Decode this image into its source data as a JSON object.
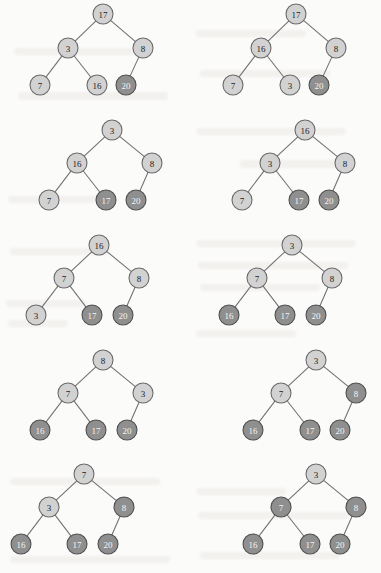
{
  "page": {
    "background_color": "#fbfbfa",
    "node_fill_light": "#d2d2d2",
    "node_fill_dark": "#8f8f8f",
    "node_stroke": "#6a6a6a",
    "edge_color": "#6f6f6f",
    "node_radius": 10,
    "columns": 2,
    "rows": 5,
    "total_trees": 10
  },
  "trees": [
    {
      "id": "tree-1",
      "row": 1,
      "column": "left",
      "nodes": [
        {
          "key": "root",
          "label": "17",
          "shade": "light",
          "x": 103,
          "y": 14
        },
        {
          "key": "left",
          "label": "3",
          "shade": "light",
          "x": 68,
          "y": 48
        },
        {
          "key": "right",
          "label": "8",
          "shade": "light",
          "x": 143,
          "y": 48
        },
        {
          "key": "left-left",
          "label": "7",
          "shade": "light",
          "x": 40,
          "y": 85
        },
        {
          "key": "left-right",
          "label": "16",
          "shade": "light",
          "x": 97,
          "y": 85
        },
        {
          "key": "right-left",
          "label": "20",
          "shade": "dark",
          "x": 126,
          "y": 85
        }
      ],
      "edges": [
        [
          "root",
          "left"
        ],
        [
          "root",
          "right"
        ],
        [
          "left",
          "left-left"
        ],
        [
          "left",
          "left-right"
        ],
        [
          "right",
          "right-left"
        ]
      ]
    },
    {
      "id": "tree-2",
      "row": 1,
      "column": "right",
      "nodes": [
        {
          "key": "root",
          "label": "17",
          "shade": "light",
          "x": 296,
          "y": 14
        },
        {
          "key": "left",
          "label": "16",
          "shade": "light",
          "x": 261,
          "y": 48
        },
        {
          "key": "right",
          "label": "8",
          "shade": "light",
          "x": 336,
          "y": 48
        },
        {
          "key": "left-left",
          "label": "7",
          "shade": "light",
          "x": 233,
          "y": 85
        },
        {
          "key": "left-right",
          "label": "3",
          "shade": "light",
          "x": 290,
          "y": 85
        },
        {
          "key": "right-left",
          "label": "20",
          "shade": "dark",
          "x": 319,
          "y": 85
        }
      ],
      "edges": [
        [
          "root",
          "left"
        ],
        [
          "root",
          "right"
        ],
        [
          "left",
          "left-left"
        ],
        [
          "left",
          "left-right"
        ],
        [
          "right",
          "right-left"
        ]
      ]
    },
    {
      "id": "tree-3",
      "row": 2,
      "column": "left",
      "nodes": [
        {
          "key": "root",
          "label": "3",
          "shade": "light",
          "x": 112,
          "y": 130
        },
        {
          "key": "left",
          "label": "16",
          "shade": "light",
          "x": 77,
          "y": 163
        },
        {
          "key": "right",
          "label": "8",
          "shade": "light",
          "x": 152,
          "y": 163
        },
        {
          "key": "left-left",
          "label": "7",
          "shade": "light",
          "x": 49,
          "y": 200
        },
        {
          "key": "left-right",
          "label": "17",
          "shade": "dark",
          "x": 106,
          "y": 200
        },
        {
          "key": "right-left",
          "label": "20",
          "shade": "dark",
          "x": 136,
          "y": 200
        }
      ],
      "edges": [
        [
          "root",
          "left"
        ],
        [
          "root",
          "right"
        ],
        [
          "left",
          "left-left"
        ],
        [
          "left",
          "left-right"
        ],
        [
          "right",
          "right-left"
        ]
      ]
    },
    {
      "id": "tree-4",
      "row": 2,
      "column": "right",
      "nodes": [
        {
          "key": "root",
          "label": "16",
          "shade": "light",
          "x": 305,
          "y": 130
        },
        {
          "key": "left",
          "label": "3",
          "shade": "light",
          "x": 270,
          "y": 163
        },
        {
          "key": "right",
          "label": "8",
          "shade": "light",
          "x": 345,
          "y": 163
        },
        {
          "key": "left-left",
          "label": "7",
          "shade": "light",
          "x": 242,
          "y": 200
        },
        {
          "key": "left-right",
          "label": "17",
          "shade": "dark",
          "x": 299,
          "y": 200
        },
        {
          "key": "right-left",
          "label": "20",
          "shade": "dark",
          "x": 329,
          "y": 200
        }
      ],
      "edges": [
        [
          "root",
          "left"
        ],
        [
          "root",
          "right"
        ],
        [
          "left",
          "left-left"
        ],
        [
          "left",
          "left-right"
        ],
        [
          "right",
          "right-left"
        ]
      ]
    },
    {
      "id": "tree-5",
      "row": 3,
      "column": "left",
      "nodes": [
        {
          "key": "root",
          "label": "16",
          "shade": "light",
          "x": 99,
          "y": 245
        },
        {
          "key": "left",
          "label": "7",
          "shade": "light",
          "x": 64,
          "y": 278
        },
        {
          "key": "right",
          "label": "8",
          "shade": "light",
          "x": 139,
          "y": 278
        },
        {
          "key": "left-left",
          "label": "3",
          "shade": "light",
          "x": 36,
          "y": 315
        },
        {
          "key": "left-right",
          "label": "17",
          "shade": "dark",
          "x": 92,
          "y": 315
        },
        {
          "key": "right-left",
          "label": "20",
          "shade": "dark",
          "x": 123,
          "y": 315
        }
      ],
      "edges": [
        [
          "root",
          "left"
        ],
        [
          "root",
          "right"
        ],
        [
          "left",
          "left-left"
        ],
        [
          "left",
          "left-right"
        ],
        [
          "right",
          "right-left"
        ]
      ]
    },
    {
      "id": "tree-6",
      "row": 3,
      "column": "right",
      "nodes": [
        {
          "key": "root",
          "label": "3",
          "shade": "light",
          "x": 292,
          "y": 245
        },
        {
          "key": "left",
          "label": "7",
          "shade": "light",
          "x": 257,
          "y": 278
        },
        {
          "key": "right",
          "label": "8",
          "shade": "light",
          "x": 332,
          "y": 278
        },
        {
          "key": "left-left",
          "label": "16",
          "shade": "dark",
          "x": 229,
          "y": 315
        },
        {
          "key": "left-right",
          "label": "17",
          "shade": "dark",
          "x": 285,
          "y": 315
        },
        {
          "key": "right-left",
          "label": "20",
          "shade": "dark",
          "x": 316,
          "y": 315
        }
      ],
      "edges": [
        [
          "root",
          "left"
        ],
        [
          "root",
          "right"
        ],
        [
          "left",
          "left-left"
        ],
        [
          "left",
          "left-right"
        ],
        [
          "right",
          "right-left"
        ]
      ]
    },
    {
      "id": "tree-7",
      "row": 4,
      "column": "left",
      "nodes": [
        {
          "key": "root",
          "label": "8",
          "shade": "light",
          "x": 103,
          "y": 360
        },
        {
          "key": "left",
          "label": "7",
          "shade": "light",
          "x": 68,
          "y": 393
        },
        {
          "key": "right",
          "label": "3",
          "shade": "light",
          "x": 143,
          "y": 393
        },
        {
          "key": "left-left",
          "label": "16",
          "shade": "dark",
          "x": 40,
          "y": 430
        },
        {
          "key": "left-right",
          "label": "17",
          "shade": "dark",
          "x": 96,
          "y": 430
        },
        {
          "key": "right-left",
          "label": "20",
          "shade": "dark",
          "x": 127,
          "y": 430
        }
      ],
      "edges": [
        [
          "root",
          "left"
        ],
        [
          "root",
          "right"
        ],
        [
          "left",
          "left-left"
        ],
        [
          "left",
          "left-right"
        ],
        [
          "right",
          "right-left"
        ]
      ]
    },
    {
      "id": "tree-8",
      "row": 4,
      "column": "right",
      "nodes": [
        {
          "key": "root",
          "label": "3",
          "shade": "light",
          "x": 316,
          "y": 360
        },
        {
          "key": "left",
          "label": "7",
          "shade": "light",
          "x": 281,
          "y": 393
        },
        {
          "key": "right",
          "label": "8",
          "shade": "dark",
          "x": 356,
          "y": 393
        },
        {
          "key": "left-left",
          "label": "16",
          "shade": "dark",
          "x": 253,
          "y": 430
        },
        {
          "key": "left-right",
          "label": "17",
          "shade": "dark",
          "x": 310,
          "y": 430
        },
        {
          "key": "right-left",
          "label": "20",
          "shade": "dark",
          "x": 340,
          "y": 430
        }
      ],
      "edges": [
        [
          "root",
          "left"
        ],
        [
          "root",
          "right"
        ],
        [
          "left",
          "left-left"
        ],
        [
          "left",
          "left-right"
        ],
        [
          "right",
          "right-left"
        ]
      ]
    },
    {
      "id": "tree-9",
      "row": 5,
      "column": "left",
      "nodes": [
        {
          "key": "root",
          "label": "7",
          "shade": "light",
          "x": 84,
          "y": 474
        },
        {
          "key": "left",
          "label": "3",
          "shade": "light",
          "x": 49,
          "y": 507
        },
        {
          "key": "right",
          "label": "8",
          "shade": "dark",
          "x": 124,
          "y": 507
        },
        {
          "key": "left-left",
          "label": "16",
          "shade": "dark",
          "x": 21,
          "y": 544
        },
        {
          "key": "left-right",
          "label": "17",
          "shade": "dark",
          "x": 77,
          "y": 544
        },
        {
          "key": "right-left",
          "label": "20",
          "shade": "dark",
          "x": 108,
          "y": 544
        }
      ],
      "edges": [
        [
          "root",
          "left"
        ],
        [
          "root",
          "right"
        ],
        [
          "left",
          "left-left"
        ],
        [
          "left",
          "left-right"
        ],
        [
          "right",
          "right-left"
        ]
      ]
    },
    {
      "id": "tree-10",
      "row": 5,
      "column": "right",
      "nodes": [
        {
          "key": "root",
          "label": "3",
          "shade": "light",
          "x": 316,
          "y": 474
        },
        {
          "key": "left",
          "label": "7",
          "shade": "dark",
          "x": 281,
          "y": 507
        },
        {
          "key": "right",
          "label": "8",
          "shade": "dark",
          "x": 356,
          "y": 507
        },
        {
          "key": "left-left",
          "label": "16",
          "shade": "dark",
          "x": 253,
          "y": 544
        },
        {
          "key": "left-right",
          "label": "17",
          "shade": "dark",
          "x": 310,
          "y": 544
        },
        {
          "key": "right-left",
          "label": "20",
          "shade": "dark",
          "x": 340,
          "y": 544
        }
      ],
      "edges": [
        [
          "root",
          "left"
        ],
        [
          "root",
          "right"
        ],
        [
          "left",
          "left-left"
        ],
        [
          "left",
          "left-right"
        ],
        [
          "right",
          "right-left"
        ]
      ]
    }
  ],
  "background_artifacts": [
    {
      "x": 14,
      "y": 48,
      "w": 120,
      "h": 7
    },
    {
      "x": 18,
      "y": 92,
      "w": 150,
      "h": 8
    },
    {
      "x": 196,
      "y": 30,
      "w": 110,
      "h": 7
    },
    {
      "x": 200,
      "y": 70,
      "w": 130,
      "h": 7
    },
    {
      "x": 196,
      "y": 128,
      "w": 150,
      "h": 7
    },
    {
      "x": 240,
      "y": 160,
      "w": 110,
      "h": 8
    },
    {
      "x": 8,
      "y": 196,
      "w": 90,
      "h": 7
    },
    {
      "x": 10,
      "y": 248,
      "w": 100,
      "h": 7
    },
    {
      "x": 196,
      "y": 240,
      "w": 160,
      "h": 7
    },
    {
      "x": 198,
      "y": 262,
      "w": 150,
      "h": 7
    },
    {
      "x": 200,
      "y": 284,
      "w": 120,
      "h": 7
    },
    {
      "x": 6,
      "y": 300,
      "w": 80,
      "h": 7
    },
    {
      "x": 8,
      "y": 320,
      "w": 60,
      "h": 7
    },
    {
      "x": 196,
      "y": 330,
      "w": 100,
      "h": 7
    },
    {
      "x": 10,
      "y": 478,
      "w": 150,
      "h": 7
    },
    {
      "x": 196,
      "y": 488,
      "w": 90,
      "h": 7
    },
    {
      "x": 198,
      "y": 512,
      "w": 150,
      "h": 7
    },
    {
      "x": 10,
      "y": 556,
      "w": 160,
      "h": 7
    },
    {
      "x": 200,
      "y": 552,
      "w": 140,
      "h": 7
    }
  ]
}
